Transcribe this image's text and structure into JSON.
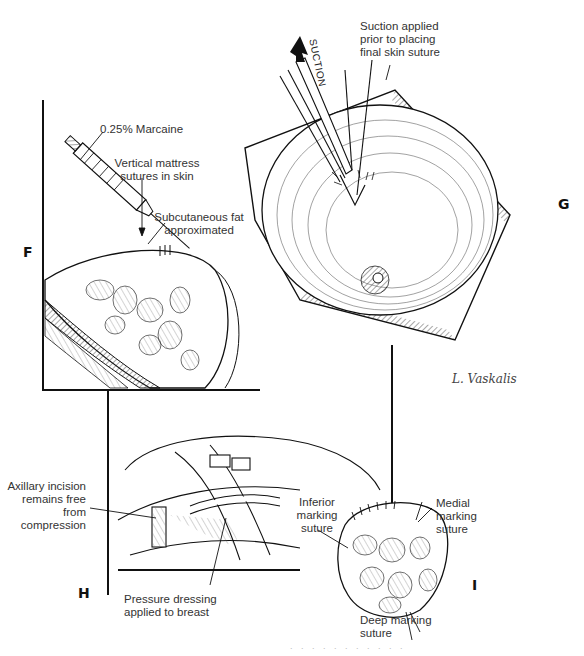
{
  "figure": {
    "panels": [
      {
        "id": "F",
        "letter": "F"
      },
      {
        "id": "G",
        "letter": "G"
      },
      {
        "id": "H",
        "letter": "H"
      },
      {
        "id": "I",
        "letter": "I"
      }
    ],
    "labels": {
      "marcaine": "0.25% Marcaine",
      "vertical_mattress": [
        "Vertical mattress",
        "sutures in skin"
      ],
      "subcutaneous_fat": [
        "Subcutaneous fat",
        "approximated"
      ],
      "suction_applied": [
        "Suction applied",
        "prior to placing",
        "final skin suture"
      ],
      "suction_arrow": "SUCTION",
      "axillary_incision": [
        "Axillary incision",
        "remains free",
        "from",
        "compression"
      ],
      "pressure_dressing": [
        "Pressure dressing",
        "applied to breast"
      ],
      "inferior_marking": [
        "Inferior",
        "marking",
        "suture"
      ],
      "medial_marking": [
        "Medial",
        "marking",
        "suture"
      ],
      "deep_marking": [
        "Deep marking",
        "suture"
      ]
    },
    "signature": "L. Vaskalis",
    "caption_fragment": ". . . . . . . . . . ."
  },
  "colors": {
    "ink": "#111111",
    "background": "#ffffff",
    "label_text": "#333333"
  }
}
